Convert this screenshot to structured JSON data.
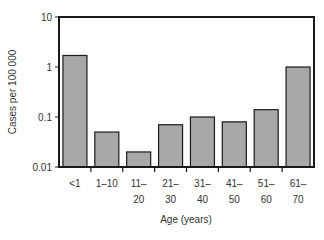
{
  "chart_data": {
    "type": "bar",
    "title": "",
    "xlabel": "Age (years)",
    "ylabel": "Cases per 100 000",
    "yscale": "log",
    "ylim": [
      0.01,
      10
    ],
    "yticks": [
      10,
      1,
      0.1,
      0.01
    ],
    "ytick_labels": [
      "10",
      "1",
      "0.1",
      "0.01"
    ],
    "categories": [
      "<1",
      "1–10",
      "11–20",
      "21–30",
      "31–40",
      "41–50",
      "51–60",
      "61–70"
    ],
    "category_labels": [
      [
        "<1",
        ""
      ],
      [
        "1–10",
        ""
      ],
      [
        "11–",
        "20"
      ],
      [
        "21–",
        "30"
      ],
      [
        "31–",
        "40"
      ],
      [
        "41–",
        "50"
      ],
      [
        "51–",
        "60"
      ],
      [
        "61–",
        "70"
      ]
    ],
    "values": [
      1.7,
      0.05,
      0.02,
      0.07,
      0.1,
      0.08,
      0.14,
      1.0
    ],
    "grid": false,
    "legend": null,
    "bar_color": "#a8a8a8",
    "bar_edge": "#1a1a1a"
  }
}
